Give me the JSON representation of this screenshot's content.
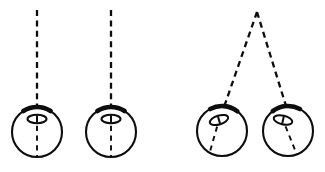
{
  "figure": {
    "background_color": "#ffffff",
    "stroke_color": "#0d0d0d",
    "width": 325,
    "height": 172,
    "caption": ""
  },
  "chart_data": {
    "type": "diagram",
    "grid": false,
    "legend": null,
    "xlabel": "",
    "ylabel": "",
    "groups": [
      {
        "name": "parallel-suspension-pair",
        "label": "",
        "apex": null,
        "suspension": "parallel-vertical",
        "spheres": [
          {
            "id": "sphere-1",
            "center": [
              37,
              132
            ],
            "radius": 25,
            "tilt_deg": 0,
            "thread": {
              "top": [
                37,
                10
              ],
              "attach": [
                37,
                107
              ],
              "exit": [
                37,
                157
              ],
              "angle_deg": 0
            },
            "eye": {
              "center": [
                37,
                119
              ],
              "rx": 9.5,
              "ry": 4.2,
              "rotation_deg": 0,
              "pupil_len": 6
            },
            "cap": {
              "center": [
                37,
                107
              ],
              "span_deg": 66
            }
          },
          {
            "id": "sphere-2",
            "center": [
              111,
              132
            ],
            "radius": 25,
            "tilt_deg": 0,
            "thread": {
              "top": [
                111,
                10
              ],
              "attach": [
                111,
                107
              ],
              "exit": [
                111,
                157
              ],
              "angle_deg": 0
            },
            "eye": {
              "center": [
                111,
                119
              ],
              "rx": 9.5,
              "ry": 4.2,
              "rotation_deg": 0,
              "pupil_len": 6
            },
            "cap": {
              "center": [
                111,
                107
              ],
              "span_deg": 66
            }
          }
        ]
      },
      {
        "name": "shared-apex-pair",
        "label": "",
        "apex": [
          257,
          12
        ],
        "suspension": "converging-v",
        "spheres": [
          {
            "id": "sphere-3",
            "center": [
              222,
              131
            ],
            "radius": 25,
            "tilt_deg": -17,
            "thread": {
              "top": [
                257,
                12
              ],
              "attach": [
                224,
                107
              ],
              "exit": [
                209,
                155
              ],
              "angle_deg": -17
            },
            "eye": {
              "center": [
                219,
                120
              ],
              "rx": 9.5,
              "ry": 4.4,
              "rotation_deg": -17,
              "pupil_len": 6
            },
            "cap": {
              "center": [
                224,
                107
              ],
              "span_deg": 66
            }
          },
          {
            "id": "sphere-4",
            "center": [
              288,
              131
            ],
            "radius": 25,
            "tilt_deg": 13,
            "thread": {
              "top": [
                257,
                12
              ],
              "attach": [
                286,
                106
              ],
              "exit": [
                297,
                155
              ],
              "angle_deg": 13
            },
            "eye": {
              "center": [
                283,
                120
              ],
              "rx": 9.5,
              "ry": 4.4,
              "rotation_deg": 13,
              "pupil_len": 6
            },
            "cap": {
              "center": [
                286,
                106
              ],
              "span_deg": 66
            }
          }
        ]
      }
    ]
  }
}
